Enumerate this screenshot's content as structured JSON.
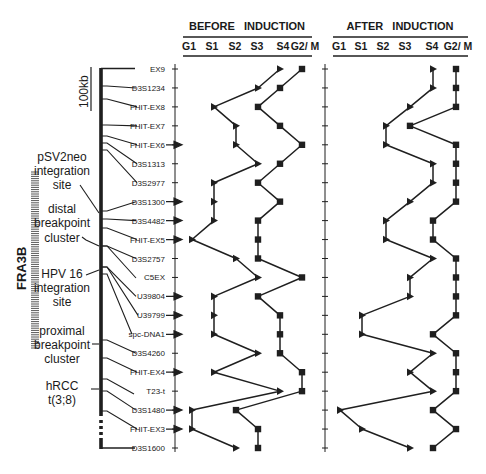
{
  "chart_data": {
    "type": "line",
    "panels": [
      {
        "title": "BEFORE  INDUCTION",
        "columns": [
          "G1",
          "S1",
          "S2",
          "S3",
          "S4",
          "G2/ M"
        ]
      },
      {
        "title": "AFTER  INDUCTION",
        "columns": [
          "G1",
          "S1",
          "S2",
          "S3",
          "S4",
          "G2/ M"
        ]
      }
    ],
    "value_scale": {
      "G1": 0,
      "S1": 1,
      "S2": 2,
      "S3": 3,
      "S4": 4,
      "G2/M": 5
    },
    "markers": [
      "EX9",
      "D3S1234",
      "FHIT-EX8",
      "FHIT-EX7",
      "FHIT-EX6",
      "D3S1313",
      "D3S2977",
      "D3S1300",
      "D3S4482",
      "FHIT-EX5",
      "D3S2757",
      "C5EX",
      "U39804",
      "U39799",
      "spc-DNA1",
      "D3S4260",
      "FHIT-EX4",
      "T23-t",
      "D3S1480",
      "FHIT-EX3",
      "D3S1600"
    ],
    "arrowed_markers": [
      "FHIT-EX6",
      "D3S1300",
      "D3S4482",
      "FHIT-EX5",
      "U39804",
      "U39799",
      "spc-DNA1",
      "FHIT-EX4",
      "D3S1480",
      "FHIT-EX3"
    ],
    "series": [
      {
        "panel": "before",
        "name": "triangle series",
        "marker": "triangle",
        "values": [
          4,
          3,
          1,
          2,
          2,
          3,
          1,
          1,
          1,
          0,
          2,
          3,
          1,
          1,
          1,
          3,
          1,
          4,
          0,
          0,
          2
        ]
      },
      {
        "panel": "before",
        "name": "square series",
        "marker": "square",
        "values": [
          5,
          4,
          3,
          4,
          5,
          4,
          3,
          4,
          3,
          3,
          3,
          5,
          3,
          4,
          4,
          4,
          5,
          5,
          2,
          3,
          3
        ]
      },
      {
        "panel": "after",
        "name": "triangle series",
        "marker": "triangle",
        "values": [
          4,
          4,
          3,
          2,
          2,
          4,
          4,
          3,
          2,
          2,
          4,
          3,
          3,
          1,
          1,
          4,
          3,
          4,
          0,
          1,
          3
        ]
      },
      {
        "panel": "after",
        "name": "square series",
        "marker": "square",
        "values": [
          5,
          5,
          5,
          3,
          5,
          5,
          5,
          5,
          4,
          4,
          5,
          5,
          5,
          5,
          4,
          5,
          5,
          5,
          4,
          5,
          4
        ]
      }
    ],
    "xlabel": "cell cycle stage",
    "ylabel": "",
    "legend": "none",
    "grid": false
  },
  "map": {
    "scale_label": "100kb",
    "region_label": "FRA3B",
    "annotations": [
      {
        "id": "psv2neo",
        "lines": [
          "pSV2neo",
          "integration",
          "site"
        ]
      },
      {
        "id": "distal",
        "lines": [
          "distal",
          "breakpoint",
          "cluster"
        ]
      },
      {
        "id": "hpv16",
        "lines": [
          "HPV 16",
          "integration",
          "site"
        ]
      },
      {
        "id": "proximal",
        "lines": [
          "proximal",
          "breakpoint",
          "cluster"
        ]
      },
      {
        "id": "hrcc",
        "lines": [
          "hRCC",
          "t(3;8)"
        ]
      }
    ]
  }
}
